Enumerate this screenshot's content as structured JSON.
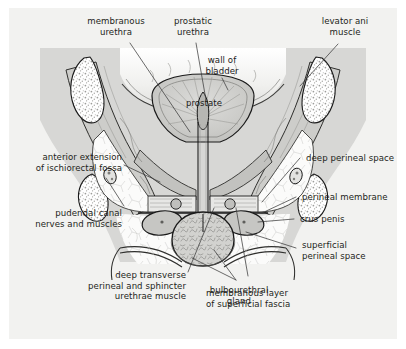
{
  "figure": {
    "background_color": "#ffffff",
    "plate_color": "#f2f2f0",
    "text_color": "#231f20",
    "leader_color": "#3b3b3b",
    "outline_color": "#1a1a1a",
    "muscle_fill": "#c9c9c7",
    "muscle_fill_dark": "#b4b4b1",
    "bone_fill": "#ffffff",
    "bladder_fill": "#e3e3e1",
    "fat_fill": "#fafafa"
  },
  "labels": {
    "membranous_urethra": "membranous\nurethra",
    "prostatic_urethra": "prostatic\nurethra",
    "levator_ani_muscle": "levator ani\nmuscle",
    "wall_of_bladder": "wall of\nbladder",
    "prostate": "prostate",
    "anterior_extension_ischiorectal_fossa": "anterior extension\nof ischiorectal fossa",
    "pudendal_canal": "pudendal canal\nnerves and muscles",
    "deep_transverse_perineal": "deep transverse\nperineal and sphincter\nurethrae muscle",
    "bulbourethral_gland": "bulbourethral\ngland",
    "membranous_layer_superficial_fascia": "membranous layer\nof superficial fascia",
    "deep_perineal_space": "deep perineal space",
    "perineal_membrane": "perineal membrane",
    "crus_penis": "crus penis",
    "superficial_perineal_space": "superficial\nperineal space"
  }
}
